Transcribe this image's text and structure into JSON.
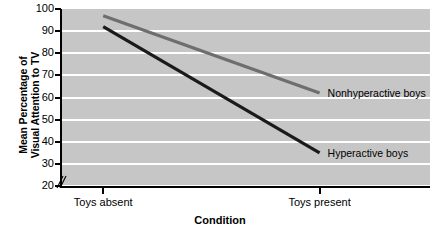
{
  "chart_data": {
    "type": "line",
    "title": "",
    "subtitle": "",
    "xlabel": "Condition",
    "ylabel": "Mean Percentage of Visual Attention to TV",
    "ylabel_line1": "Mean Percentage of",
    "ylabel_line2": "Visual Attention to TV",
    "categories": [
      "Toys absent",
      "Toys present"
    ],
    "ylim": [
      20,
      100
    ],
    "yticks": [
      20,
      30,
      40,
      50,
      60,
      70,
      80,
      90,
      100
    ],
    "ytick_labels": [
      "20",
      "30",
      "40",
      "50",
      "60",
      "70",
      "80",
      "90",
      "100"
    ],
    "grid": true,
    "grid_color": "#ffffff",
    "plot_background": "#c6c6c6",
    "axis_break": true,
    "legend_position": "inline-right",
    "series": [
      {
        "name": "Nonhyperactive boys",
        "values": [
          97,
          62
        ],
        "color": "#6e6e6e"
      },
      {
        "name": "Hyperactive boys",
        "values": [
          92,
          35
        ],
        "color": "#1a1a1a"
      }
    ]
  },
  "axis": {
    "y_title_line1": "Mean Percentage of",
    "y_title_line2": "Visual Attention to TV",
    "x_title": "Condition"
  },
  "labels": {
    "nonhyperactive": "Nonhyperactive boys",
    "hyperactive": "Hyperactive boys"
  }
}
